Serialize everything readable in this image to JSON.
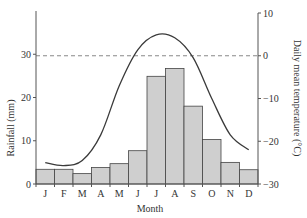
{
  "chart_data": {
    "type": "bar+line",
    "title": "",
    "xlabel": "Month",
    "categories": [
      "J",
      "F",
      "M",
      "A",
      "M",
      "J",
      "J",
      "A",
      "S",
      "O",
      "N",
      "D"
    ],
    "series": [
      {
        "name": "Rainfall (mm)",
        "type": "bar",
        "axis": "left",
        "values": [
          3.4,
          3.4,
          2.4,
          3.8,
          4.7,
          7.7,
          24.9,
          26.7,
          18.0,
          10.3,
          5.0,
          3.3
        ]
      },
      {
        "name": "Daily mean temperature (°C)",
        "type": "line",
        "axis": "right",
        "values": [
          -25,
          -25.7,
          -24.5,
          -18.5,
          -7,
          1.4,
          4.9,
          4.2,
          -0.5,
          -10,
          -18.5,
          -22
        ]
      }
    ],
    "left_axis": {
      "label": "Rainfall (mm)",
      "ylim": [
        0,
        40
      ],
      "ticks": [
        0,
        10,
        20,
        30
      ]
    },
    "right_axis": {
      "label": "Daily mean temperature (°C)",
      "ylim": [
        -30,
        10
      ],
      "ticks": [
        10,
        0,
        -10,
        -20,
        -30
      ]
    },
    "reference_line": {
      "axis": "right",
      "value": 0,
      "style": "dashed"
    },
    "grid": false,
    "legend": "none"
  },
  "labels": {
    "xlabel": "Month",
    "ylabel_left": "Rainfall (mm)",
    "ylabel_right": "Daily mean temperature (°C)"
  },
  "colors": {
    "bar_fill": "#cfcfcf",
    "bar_stroke": "#444444",
    "line": "#3a3a3a",
    "axis": "#555555",
    "dashed": "#888888"
  }
}
